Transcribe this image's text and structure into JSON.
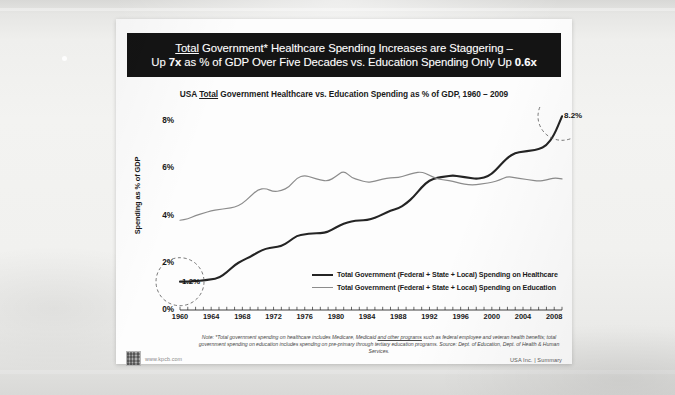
{
  "slide": {
    "headline_line1_pre": "Total",
    "headline_line1_rest": " Government* Healthcare Spending Increases are Staggering –",
    "headline_line2_a": "Up ",
    "headline_line2_b": "7x",
    "headline_line2_c": " as % of GDP Over Five Decades vs. Education Spending Only Up ",
    "headline_line2_d": "0.6x",
    "chart_title_a": "USA ",
    "chart_title_b": "Total",
    "chart_title_c": " Government Healthcare vs. Education Spending as % of GDP, 1960 – 2009",
    "footnote_a": "Note: *Total government spending on healthcare includes Medicare, Medicaid ",
    "footnote_b": "and other programs",
    "footnote_c": " such as federal employee and veteran health benefits; total government spending on education includes spending on pre-primary through tertiary education programs. Source: Dept. of Education, Dept. of Health & Human Services.",
    "attribution": "USA Inc. | Summary",
    "kpcb_url": "www.kpcb.com"
  },
  "legend": {
    "healthcare_label": "Total Government (Federal + State + Local) Spending on Healthcare",
    "education_label": "Total Government (Federal + State + Local) Spending on Education"
  },
  "annotations": {
    "start_value": "1.2%",
    "end_value": "8.2%"
  },
  "colors": {
    "banner_bg": "#141414",
    "banner_text": "#ffffff",
    "healthcare_line": "#242424",
    "education_line": "#8c8c8c",
    "slide_bg": "#fdfdfd",
    "axis": "#2a2a2a"
  },
  "chart_data": {
    "type": "line",
    "title": "USA Total Government Healthcare vs. Education Spending as % of GDP, 1960 – 2009",
    "xlabel": "",
    "ylabel": "Spending as % of GDP",
    "xlim": [
      1960,
      2009
    ],
    "ylim": [
      0,
      8
    ],
    "yticks": [
      0,
      2,
      4,
      6,
      8
    ],
    "ytick_labels": [
      "0%",
      "2%",
      "4%",
      "6%",
      "8%"
    ],
    "xticks": [
      1960,
      1964,
      1968,
      1972,
      1976,
      1980,
      1984,
      1988,
      1992,
      1996,
      2000,
      2004,
      2008
    ],
    "xtick_labels": [
      "1960",
      "1964",
      "1968",
      "1972",
      "1976",
      "1980",
      "1984",
      "1988",
      "1992",
      "1996",
      "2000",
      "2004",
      "2008"
    ],
    "minor_xticks_every": 1,
    "grid": false,
    "legend_position": "inside-center-lower",
    "annotations": [
      {
        "label": "1.2%",
        "x": 1960,
        "y": 1.2,
        "marker": "dashed-circle"
      },
      {
        "label": "8.2%",
        "x": 2009,
        "y": 8.2,
        "marker": "dashed-circle"
      }
    ],
    "x": [
      1960,
      1961,
      1962,
      1963,
      1964,
      1965,
      1966,
      1967,
      1968,
      1969,
      1970,
      1971,
      1972,
      1973,
      1974,
      1975,
      1976,
      1977,
      1978,
      1979,
      1980,
      1981,
      1982,
      1983,
      1984,
      1985,
      1986,
      1987,
      1988,
      1989,
      1990,
      1991,
      1992,
      1993,
      1994,
      1995,
      1996,
      1997,
      1998,
      1999,
      2000,
      2001,
      2002,
      2003,
      2004,
      2005,
      2006,
      2007,
      2008,
      2009
    ],
    "series": [
      {
        "name": "Total Government (Federal + State + Local) Spending on Healthcare",
        "color": "#242424",
        "width": 2.1,
        "values": [
          1.2,
          1.2,
          1.22,
          1.25,
          1.3,
          1.35,
          1.6,
          1.9,
          2.1,
          2.25,
          2.45,
          2.6,
          2.65,
          2.7,
          2.9,
          3.15,
          3.2,
          3.25,
          3.25,
          3.3,
          3.5,
          3.65,
          3.75,
          3.8,
          3.8,
          3.9,
          4.05,
          4.2,
          4.3,
          4.5,
          4.8,
          5.2,
          5.5,
          5.6,
          5.65,
          5.7,
          5.65,
          5.6,
          5.55,
          5.6,
          5.75,
          6.1,
          6.45,
          6.65,
          6.7,
          6.75,
          6.8,
          6.95,
          7.4,
          8.2
        ]
      },
      {
        "name": "Total Government (Federal + State + Local) Spending on Education",
        "color": "#8c8c8c",
        "width": 1.2,
        "values": [
          3.8,
          3.85,
          4.0,
          4.1,
          4.2,
          4.25,
          4.3,
          4.35,
          4.5,
          4.8,
          5.1,
          5.15,
          5.0,
          5.05,
          5.2,
          5.6,
          5.7,
          5.6,
          5.5,
          5.45,
          5.65,
          5.9,
          5.6,
          5.5,
          5.4,
          5.45,
          5.55,
          5.6,
          5.6,
          5.7,
          5.8,
          5.85,
          5.7,
          5.55,
          5.5,
          5.45,
          5.35,
          5.3,
          5.3,
          5.35,
          5.4,
          5.5,
          5.65,
          5.6,
          5.55,
          5.5,
          5.45,
          5.5,
          5.6,
          5.55
        ]
      }
    ]
  }
}
